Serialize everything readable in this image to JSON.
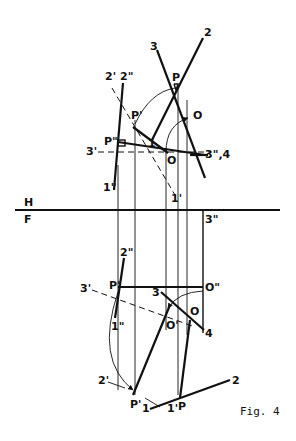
{
  "figure": {
    "caption": "Fig. 4",
    "folding_line": {
      "upper": "H",
      "lower": "F"
    }
  },
  "top_view": {
    "labels": {
      "l3": "3",
      "l2": "2",
      "P": "P",
      "O": "O",
      "l2p": "2'",
      "l2pp": "2\"",
      "Pp": "P'",
      "Ppp": "P\"",
      "l3p": "3'",
      "l1": "1",
      "O2": "O",
      "l3pp4": "3\",4",
      "l1pp": "1\"",
      "l1p": "1'"
    }
  },
  "front_view": {
    "labels": {
      "l3pp": "3\"",
      "l2pp": "2\"",
      "Pp": "P'",
      "Opp": "O\"",
      "l3p": "3'",
      "l3": "3",
      "O": "O",
      "Op": "O'",
      "l4": "4",
      "l1pp": "1\"",
      "l2p": "2'",
      "Pp2": "P'",
      "l1": "1",
      "l1p": "1'",
      "P": "P",
      "l2": "2"
    }
  }
}
